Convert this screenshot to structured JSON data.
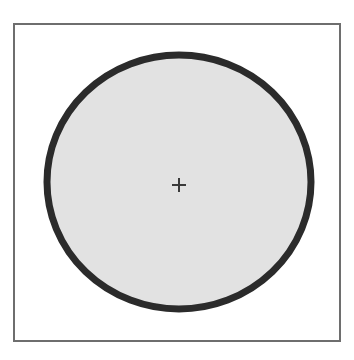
{
  "figure": {
    "canvas": {
      "width": 354,
      "height": 360,
      "background": "#ffffff"
    },
    "frame": {
      "label": "grid-frame",
      "x": 14,
      "y": 24,
      "width": 326,
      "height": 317,
      "border_color": "#6e6e6e",
      "border_width": 1.6,
      "fill": "#ffffff"
    },
    "grid": {
      "label": "graph-paper-grid",
      "cell_size": 19.5,
      "columns": 17,
      "rows": 16,
      "line_color": "#b9b9b9",
      "line_width": 1,
      "visible": true
    },
    "shapes": [
      {
        "label": "filled-circle",
        "type": "ellipse",
        "cx": 179,
        "cy": 182,
        "rx": 132,
        "ry": 127,
        "fill_color": "#e2e2e2",
        "outline_color": "#2b2b2b",
        "outline_width": 7
      },
      {
        "label": "center-crosshair",
        "type": "crosshair",
        "cx": 179,
        "cy": 185,
        "arm_length": 7,
        "color": "#3a3a3a",
        "stroke_width": 2
      }
    ]
  },
  "chart_data": {
    "type": "scatter",
    "xlabel": "",
    "ylabel": "",
    "xlim": [
      0,
      17
    ],
    "ylim": [
      0,
      16
    ],
    "grid": true,
    "legend": "none",
    "annotations": [
      {
        "name": "circle-outline",
        "shape": "circle",
        "center_grid": [
          8.46,
          8.1
        ],
        "radius_grid_x": 6.77,
        "radius_grid_y": 6.51,
        "fill": "#e2e2e2",
        "edge": "#2b2b2b",
        "linewidth_px": 7
      },
      {
        "name": "center-marker",
        "shape": "plus",
        "center_grid": [
          8.46,
          8.26
        ],
        "size_px": 14,
        "color": "#3a3a3a"
      }
    ],
    "series": [
      {
        "name": "center-point",
        "x": [
          8.46
        ],
        "y": [
          8.26
        ],
        "marker": "+"
      }
    ]
  }
}
